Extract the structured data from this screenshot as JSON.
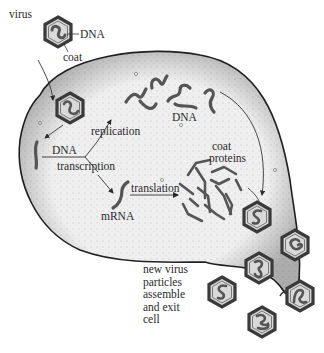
{
  "diagram": {
    "labels": {
      "virus": "virus",
      "dna_top": "DNA",
      "coat": "coat",
      "replication": "replication",
      "dna_left": "DNA",
      "transcription": "transcription",
      "mrna": "mRNA",
      "translation": "translation",
      "dna_middle": "DNA",
      "coat_proteins_1": "coat",
      "coat_proteins_2": "proteins",
      "exit_1": "new virus",
      "exit_2": "particles",
      "exit_3": "assemble",
      "exit_4": "and exit",
      "exit_5": "cell"
    },
    "colors": {
      "cell_fill": "#ececec",
      "outline": "#2b2b2b",
      "strand": "#555555",
      "hex_fill": "#d9d9d9",
      "text": "#2a2a2a"
    },
    "new_virus_count": 6
  }
}
